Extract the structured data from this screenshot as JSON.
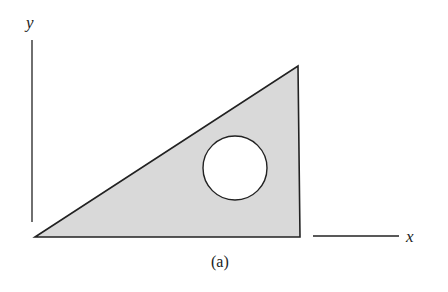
{
  "diagram": {
    "axis_labels": {
      "y": "y",
      "x": "x"
    },
    "caption": "(a)",
    "colors": {
      "fill": "#d9d9d9",
      "stroke": "#222222",
      "hole": "#ffffff"
    },
    "shape": {
      "type": "right-triangle-with-circular-hole",
      "vertices": [
        [
          35,
          237
        ],
        [
          298,
          66
        ],
        [
          300,
          237
        ]
      ],
      "hole": {
        "cx": 235,
        "cy": 168,
        "r": 32
      }
    }
  }
}
